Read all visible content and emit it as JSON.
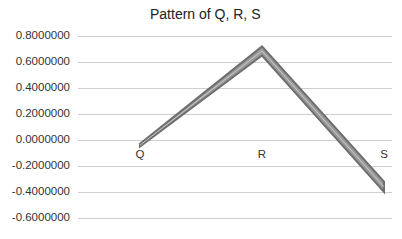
{
  "chart_data": {
    "type": "line",
    "title": "Pattern of Q, R, S",
    "xlabel": "",
    "ylabel": "",
    "categories": [
      "Q",
      "R",
      "S"
    ],
    "series": [
      {
        "name": "upper",
        "values": [
          -0.03,
          0.72,
          -0.32
        ]
      },
      {
        "name": "lower",
        "values": [
          -0.05,
          0.65,
          -0.4
        ]
      }
    ],
    "yticks": [
      "0.8000000",
      "0.6000000",
      "0.4000000",
      "0.2000000",
      "0.0000000",
      "-0.2000000",
      "-0.4000000",
      "-0.6000000"
    ],
    "ylim": [
      -0.6,
      0.8
    ],
    "grid": true,
    "legend": "none",
    "line_color": "#6e6e6e"
  }
}
